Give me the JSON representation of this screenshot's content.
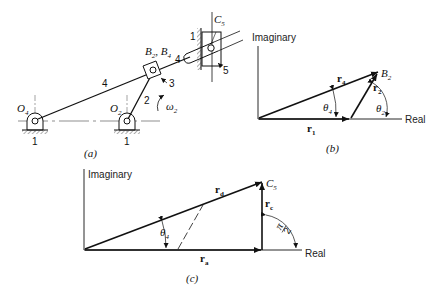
{
  "panel_a": {
    "caption": "(a)",
    "labels": {
      "o4": "O",
      "o4_sub": "4",
      "o2": "O",
      "o2_sub": "2",
      "b": "B",
      "b_sub2": "2",
      "b_sep": ", ",
      "b4": "B",
      "b_sub4": "4",
      "c": "C",
      "c_sub": "5",
      "omega": "ω",
      "omega_sub": "2",
      "link4_a": "4",
      "link4_b": "4",
      "link2": "2",
      "link3": "3",
      "link5": "5",
      "ground1_left": "1",
      "ground1_right": "1",
      "ground1_top": "1"
    }
  },
  "panel_b": {
    "caption": "(b)",
    "axis_imag": "Imaginary",
    "axis_real": "Real",
    "point": "B",
    "point_sub": "2",
    "vectors": {
      "r4": "r",
      "r4_sub": "4",
      "r1": "r",
      "r1_sub": "1",
      "r2": "r",
      "r2_sub": "2"
    },
    "angles": {
      "theta4": "θ",
      "theta4_sub": "4",
      "theta2": "θ",
      "theta2_sub": "2"
    }
  },
  "panel_c": {
    "caption": "(c)",
    "axis_imag": "Imaginary",
    "axis_real": "Real",
    "point": "C",
    "point_sub": "5",
    "vectors": {
      "rd": "r",
      "rd_sub": "d",
      "ra": "r",
      "ra_sub": "a",
      "rc": "r",
      "rc_sub": "c"
    },
    "angles": {
      "theta4": "θ",
      "theta4_sub": "4",
      "right_num": "π",
      "right_den": "2"
    }
  }
}
